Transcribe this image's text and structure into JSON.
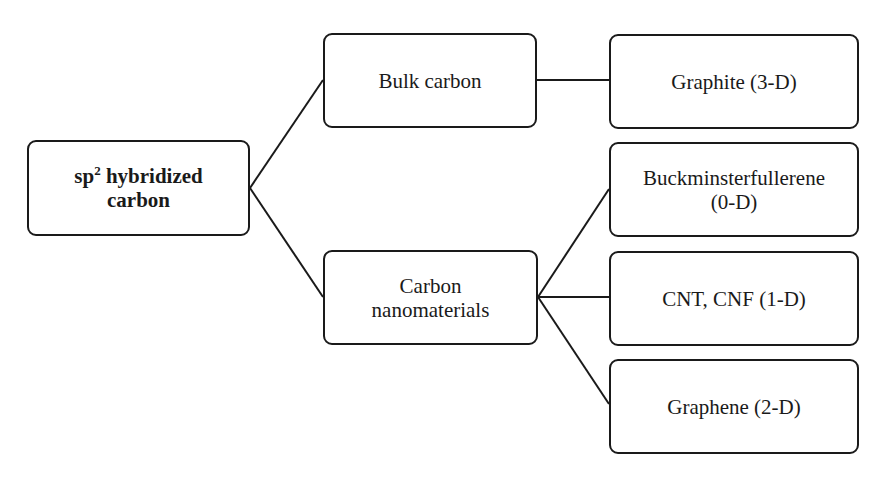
{
  "diagram": {
    "type": "tree",
    "root": {
      "label_prefix": "sp",
      "label_sup": "2",
      "label_rest": " hybridized",
      "label_line2": "carbon"
    },
    "level1": [
      {
        "label": "Bulk carbon"
      },
      {
        "label_line1": "Carbon",
        "label_line2": "nanomaterials"
      }
    ],
    "level2": [
      {
        "label": "Graphite (3-D)",
        "parent": "Bulk carbon"
      },
      {
        "label_line1": "Buckminsterfullerene",
        "label_line2": "(0-D)",
        "parent": "Carbon nanomaterials"
      },
      {
        "label": "CNT, CNF (1-D)",
        "parent": "Carbon nanomaterials"
      },
      {
        "label": "Graphene (2-D)",
        "parent": "Carbon nanomaterials"
      }
    ],
    "colors": {
      "stroke": "#1a1a1a",
      "background": "#ffffff"
    }
  }
}
